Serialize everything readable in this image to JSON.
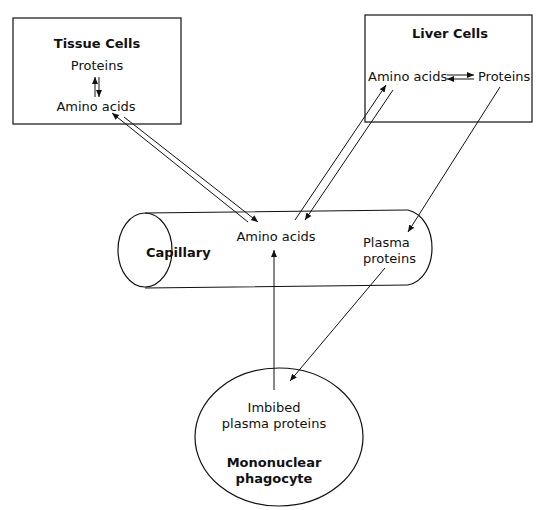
{
  "diagram": {
    "tissue_cells": {
      "title": "Tissue Cells",
      "top": "Proteins",
      "bottom": "Amino acids"
    },
    "liver_cells": {
      "title": "Liver Cells",
      "left": "Amino acids",
      "right": "Proteins"
    },
    "capillary": {
      "label": "Capillary",
      "amino": "Amino acids",
      "plasma_line1": "Plasma",
      "plasma_line2": "proteins"
    },
    "phagocyte": {
      "imbibed_line1": "Imbibed",
      "imbibed_line2": "plasma proteins",
      "title_line1": "Mononuclear",
      "title_line2": "phagocyte"
    },
    "colors": {
      "stroke": "#111111",
      "background": "#ffffff"
    }
  }
}
